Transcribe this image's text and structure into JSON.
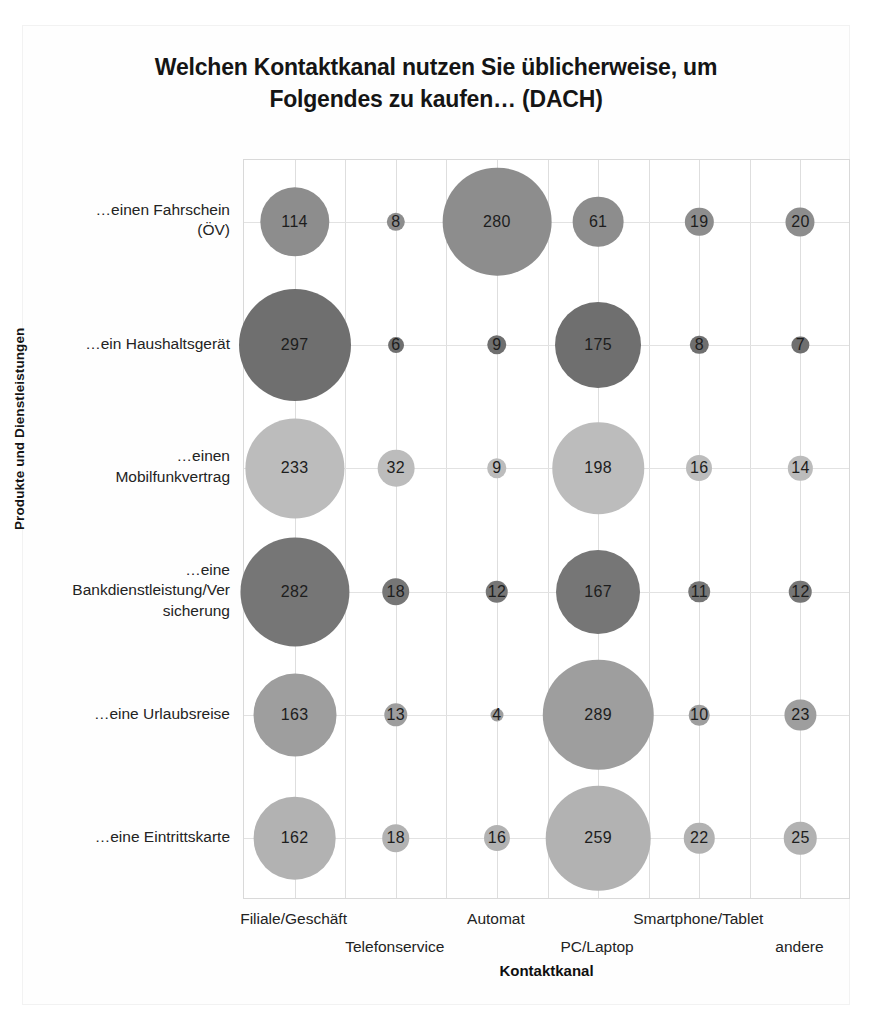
{
  "figure": {
    "title": "Welchen Kontaktkanal nutzen Sie üblicherweise, um Folgendes zu kaufen… (DACH)",
    "title_line1": "Welchen Kontaktkanal nutzen Sie üblicherweise, um",
    "title_line2": "Folgendes zu kaufen… (DACH)",
    "x_axis_title": "Kontaktkanal",
    "y_axis_title": "Produkte und Dienstleistungen",
    "background_color": "#ffffff",
    "grid_color": "#dedede",
    "border_color": "#d9d9d9"
  },
  "chart_data": {
    "type": "scatter",
    "subtype": "bubble-matrix",
    "title": "Welchen Kontaktkanal nutzen Sie üblicherweise, um Folgendes zu kaufen… (DACH)",
    "xlabel": "Kontaktkanal",
    "ylabel": "Produkte und Dienstleistungen",
    "grid": true,
    "legend": "none",
    "categories": [
      "Filiale/Geschäft",
      "Telefonservice",
      "Automat",
      "PC/Laptop",
      "Smartphone/Tablet",
      "andere"
    ],
    "rows": [
      "…einen Fahrschein (ÖV)",
      "…ein Haushaltsgerät",
      "…einen Mobilfunkvertrag",
      "…eine Bankdienstleistung/Versicherung",
      "…eine Urlaubsreise",
      "…eine Eintrittskarte"
    ],
    "row_labels_wrapped": [
      [
        "…einen Fahrschein",
        "(ÖV)"
      ],
      [
        "…ein Haushaltsgerät"
      ],
      [
        "…einen",
        "Mobilfunkvertrag"
      ],
      [
        "…eine",
        "Bankdienstleistung/Ver",
        "sicherung"
      ],
      [
        "…eine Urlaubsreise"
      ],
      [
        "…eine Eintrittskarte"
      ]
    ],
    "series": [
      {
        "name": "…einen Fahrschein (ÖV)",
        "color": "#8d8d8d",
        "values": [
          114,
          8,
          280,
          61,
          19,
          20
        ]
      },
      {
        "name": "…ein Haushaltsgerät",
        "color": "#6f6f6f",
        "values": [
          297,
          6,
          9,
          175,
          8,
          7
        ]
      },
      {
        "name": "…einen Mobilfunkvertrag",
        "color": "#bcbcbc",
        "values": [
          233,
          32,
          9,
          198,
          16,
          14
        ]
      },
      {
        "name": "…eine Bankdienstleistung/Versicherung",
        "color": "#767676",
        "values": [
          282,
          18,
          12,
          167,
          11,
          12
        ]
      },
      {
        "name": "…eine Urlaubsreise",
        "color": "#9e9e9e",
        "values": [
          163,
          13,
          4,
          289,
          10,
          23
        ]
      },
      {
        "name": "…eine Eintrittskarte",
        "color": "#b2b2b2",
        "values": [
          162,
          18,
          16,
          259,
          22,
          25
        ]
      }
    ],
    "value_range": [
      4,
      297
    ],
    "max_bubble_radius_px": 56
  }
}
